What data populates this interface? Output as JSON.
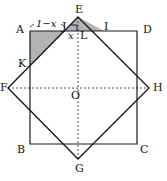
{
  "figure": {
    "type": "geometry-diagram",
    "colors": {
      "stroke": "#1a1a1a",
      "shade_fill": "#b3b3b3",
      "dotted": "#4d4d4d",
      "background": "#ffffff"
    },
    "outer_square": {
      "name": "ABCD",
      "vertices": [
        {
          "label": "A",
          "x": 30,
          "y": 31
        },
        {
          "label": "D",
          "x": 137,
          "y": 31
        },
        {
          "label": "C",
          "x": 137,
          "y": 144
        },
        {
          "label": "B",
          "x": 30,
          "y": 144
        }
      ]
    },
    "inner_square": {
      "name": "EHGF",
      "vertices": [
        {
          "label": "E",
          "x": 78,
          "y": 17
        },
        {
          "label": "H",
          "x": 149,
          "y": 88
        },
        {
          "label": "G",
          "x": 78,
          "y": 159
        },
        {
          "label": "F",
          "x": 8,
          "y": 88
        }
      ]
    },
    "points": [
      {
        "label": "J",
        "x": 65,
        "y": 31
      },
      {
        "label": "I",
        "x": 104,
        "y": 31
      },
      {
        "label": "K",
        "x": 30,
        "y": 66
      },
      {
        "label": "L",
        "x": 78,
        "y": 36
      },
      {
        "label": "O",
        "x": 78,
        "y": 88
      }
    ],
    "shaded_triangles": [
      {
        "name": "triangle-AJK",
        "vertices": [
          "A",
          "J",
          "K"
        ]
      },
      {
        "name": "triangle-JEI",
        "vertices": [
          "J",
          "E",
          "I"
        ]
      }
    ],
    "dotted_lines": [
      {
        "name": "horizontal-diagonal-FH",
        "from": "F",
        "to": "H"
      },
      {
        "name": "vertical-diagonal-EG",
        "from": "E",
        "to": "G"
      }
    ],
    "right_angle_mark": {
      "at": "J",
      "name": "right-angle-mark-J"
    },
    "labels": {
      "A": "A",
      "B": "B",
      "C": "C",
      "D": "D",
      "E": "E",
      "F": "F",
      "G": "G",
      "H": "H",
      "I": "I",
      "J": "J",
      "K": "K",
      "L": "L",
      "O": "O"
    },
    "measurements": {
      "segment_top_left": "1−x",
      "segment_short": "x"
    }
  }
}
